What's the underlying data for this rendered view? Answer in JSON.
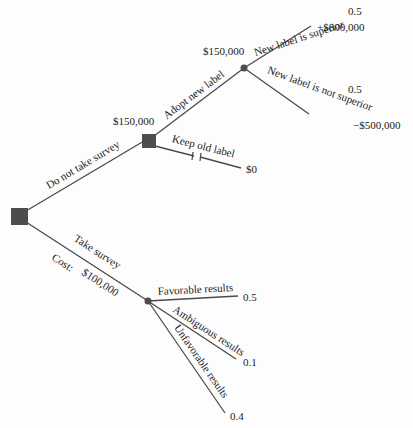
{
  "colors": {
    "line": "#4a4a4a",
    "node": "#4d4d4d",
    "text": "#222222"
  },
  "nodes": {
    "root_decision": {
      "type": "decision"
    },
    "label_decision": {
      "type": "decision",
      "value": "$150,000"
    },
    "label_chance": {
      "type": "chance",
      "value": "$150,000"
    },
    "survey_chance": {
      "type": "chance"
    }
  },
  "branches": {
    "do_not_take_survey": {
      "label": "Do not take survey"
    },
    "take_survey": {
      "label": "Take survey",
      "cost_label": "Cost:",
      "cost_value": "$100,000"
    },
    "adopt_new_label": {
      "label": "Adopt new label"
    },
    "keep_old_label": {
      "label": "Keep old label",
      "payoff": "$0"
    },
    "new_label_superior": {
      "label": "New label is superior",
      "probability": "0.5",
      "payoff": "+$800,000"
    },
    "new_label_not_superior": {
      "label": "New label is not superior",
      "probability": "0.5",
      "payoff": "−$500,000"
    },
    "favorable_results": {
      "label": "Favorable results",
      "probability": "0.5"
    },
    "ambiguous_results": {
      "label": "Ambiguous results",
      "probability": "0.1"
    },
    "unfavorable_results": {
      "label": "Unfavorable results",
      "probability": "0.4"
    }
  }
}
